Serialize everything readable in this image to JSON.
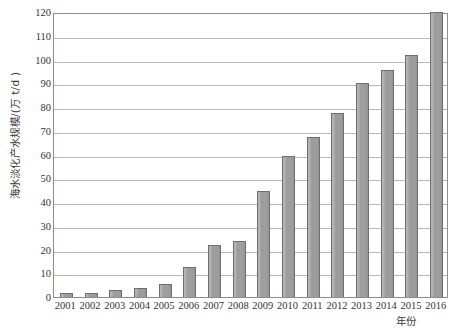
{
  "chart_data": {
    "type": "bar",
    "title": "",
    "subtitle": "",
    "xlabel": "年份",
    "ylabel": "海水淡化产水规模/(万 t/d )",
    "categories": [
      "2001",
      "2002",
      "2003",
      "2004",
      "2005",
      "2006",
      "2007",
      "2008",
      "2009",
      "2010",
      "2011",
      "2012",
      "2013",
      "2014",
      "2015",
      "2016"
    ],
    "values": [
      1.6,
      1.8,
      2.8,
      3.7,
      5.6,
      12.8,
      21.7,
      23.6,
      44.5,
      59.5,
      67.5,
      77.5,
      90.0,
      95.5,
      102.0,
      120.0
    ],
    "ylim": [
      0,
      120
    ],
    "xlim_labels": [
      "2001",
      "2016"
    ],
    "ytick_step": 10,
    "yticks": [
      0,
      10,
      20,
      30,
      40,
      50,
      60,
      70,
      80,
      90,
      100,
      110,
      120
    ],
    "ytick_labels": [
      "0",
      "10",
      "20",
      "30",
      "40",
      "50",
      "60",
      "70",
      "80",
      "90",
      "100",
      "110",
      "120"
    ],
    "grid": "horizontal",
    "legend": "none",
    "legend_position": "none",
    "annotations": [],
    "series": [
      {
        "name": "海水淡化产水规模",
        "values": [
          1.6,
          1.8,
          2.8,
          3.7,
          5.6,
          12.8,
          21.7,
          23.6,
          44.5,
          59.5,
          67.5,
          77.5,
          90.0,
          95.5,
          102.0,
          120.0
        ]
      }
    ]
  },
  "style": {
    "bar_fill": "#9d9d9d",
    "bar_border": "#6f6f6f",
    "gridline_color": "#b9b9b9",
    "frame_color": "#8d8d8d",
    "background": "#ffffff",
    "text_color": "#333333"
  }
}
